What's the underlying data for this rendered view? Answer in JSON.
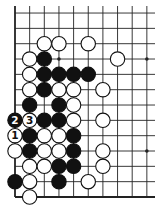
{
  "diagram": {
    "type": "go-board-fragment",
    "visible_edges": [
      "left",
      "bottom"
    ],
    "columns": 10,
    "rows": 13,
    "grid": {
      "origin_x": 15,
      "col_spacing": 14.65,
      "bottom_y": 197,
      "row_spacing": 15.33,
      "line_extend_right": 155,
      "line_extend_top": 6,
      "stone_radius": 7.2
    },
    "colors": {
      "background": "#ffffff",
      "line": "#222222",
      "black_stone": "#111111",
      "white_stone_fill": "#ffffff",
      "white_stone_stroke": "#111111"
    },
    "hoshi": [
      {
        "col": 3,
        "row": 10
      },
      {
        "col": 9,
        "row": 10
      },
      {
        "col": 9,
        "row": 4
      }
    ],
    "stones": [
      {
        "col": 2,
        "row": 11,
        "color": "white"
      },
      {
        "col": 3,
        "row": 11,
        "color": "white"
      },
      {
        "col": 5,
        "row": 11,
        "color": "white"
      },
      {
        "col": 1,
        "row": 10,
        "color": "white"
      },
      {
        "col": 2,
        "row": 10,
        "color": "black"
      },
      {
        "col": 7,
        "row": 10,
        "color": "white"
      },
      {
        "col": 1,
        "row": 9,
        "color": "white"
      },
      {
        "col": 2,
        "row": 9,
        "color": "black"
      },
      {
        "col": 3,
        "row": 9,
        "color": "black"
      },
      {
        "col": 4,
        "row": 9,
        "color": "black"
      },
      {
        "col": 5,
        "row": 9,
        "color": "black"
      },
      {
        "col": 1,
        "row": 8,
        "color": "white"
      },
      {
        "col": 2,
        "row": 8,
        "color": "black"
      },
      {
        "col": 3,
        "row": 8,
        "color": "white"
      },
      {
        "col": 4,
        "row": 8,
        "color": "white"
      },
      {
        "col": 6,
        "row": 8,
        "color": "white"
      },
      {
        "col": 1,
        "row": 7,
        "color": "black"
      },
      {
        "col": 3,
        "row": 7,
        "color": "black"
      },
      {
        "col": 4,
        "row": 7,
        "color": "white"
      },
      {
        "col": 0,
        "row": 6,
        "color": "black",
        "label": "2"
      },
      {
        "col": 1,
        "row": 6,
        "color": "white",
        "label": "3"
      },
      {
        "col": 2,
        "row": 6,
        "color": "black"
      },
      {
        "col": 3,
        "row": 6,
        "color": "black"
      },
      {
        "col": 4,
        "row": 6,
        "color": "white"
      },
      {
        "col": 6,
        "row": 6,
        "color": "white"
      },
      {
        "col": 0,
        "row": 5,
        "color": "white",
        "label": "1"
      },
      {
        "col": 1,
        "row": 5,
        "color": "black"
      },
      {
        "col": 2,
        "row": 5,
        "color": "white"
      },
      {
        "col": 3,
        "row": 5,
        "color": "white"
      },
      {
        "col": 4,
        "row": 5,
        "color": "black"
      },
      {
        "col": 0,
        "row": 4,
        "color": "white"
      },
      {
        "col": 1,
        "row": 4,
        "color": "black"
      },
      {
        "col": 2,
        "row": 4,
        "color": "white"
      },
      {
        "col": 3,
        "row": 4,
        "color": "white"
      },
      {
        "col": 4,
        "row": 4,
        "color": "black"
      },
      {
        "col": 6,
        "row": 4,
        "color": "white"
      },
      {
        "col": 1,
        "row": 3,
        "color": "white"
      },
      {
        "col": 2,
        "row": 3,
        "color": "white"
      },
      {
        "col": 3,
        "row": 3,
        "color": "black"
      },
      {
        "col": 4,
        "row": 3,
        "color": "black"
      },
      {
        "col": 6,
        "row": 3,
        "color": "white"
      },
      {
        "col": 0,
        "row": 2,
        "color": "black"
      },
      {
        "col": 1,
        "row": 2,
        "color": "white"
      },
      {
        "col": 3,
        "row": 2,
        "color": "black"
      },
      {
        "col": 5,
        "row": 2,
        "color": "white"
      },
      {
        "col": 1,
        "row": 1,
        "color": "white"
      }
    ],
    "move_labels": [
      "1",
      "2",
      "3"
    ]
  }
}
